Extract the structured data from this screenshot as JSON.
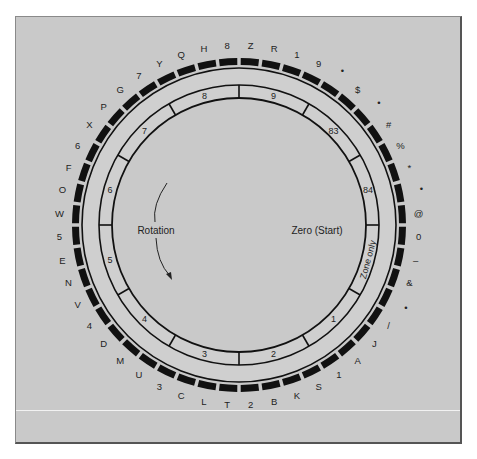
{
  "diagram": {
    "center_labels": {
      "rotation": "Rotation",
      "start": "Zero (Start)"
    },
    "cells": [
      {
        "row": "0",
        "char": "Z"
      },
      {
        "row": "11",
        "char": "R"
      },
      {
        "row": "12",
        "char": "1"
      },
      {
        "row": "N",
        "char": "9"
      },
      {
        "row": "0",
        "char": "•"
      },
      {
        "row": "11",
        "char": "$"
      },
      {
        "row": "12",
        "char": "•"
      },
      {
        "row": "N",
        "char": "#"
      },
      {
        "row": "0",
        "char": "%"
      },
      {
        "row": "11",
        "char": "*"
      },
      {
        "row": "12",
        "char": "•"
      },
      {
        "row": "N",
        "char": "@"
      },
      {
        "row": "0",
        "char": "0"
      },
      {
        "row": "11",
        "char": "–"
      },
      {
        "row": "12",
        "char": "&"
      },
      {
        "row": "N",
        "char": "•"
      },
      {
        "row": "0",
        "char": "/"
      },
      {
        "row": "11",
        "char": "J"
      },
      {
        "row": "12",
        "char": "A"
      },
      {
        "row": "N",
        "char": "1"
      },
      {
        "row": "0",
        "char": "S"
      },
      {
        "row": "11",
        "char": "K"
      },
      {
        "row": "12",
        "char": "B"
      },
      {
        "row": "N",
        "char": "2"
      },
      {
        "row": "0",
        "char": "T"
      },
      {
        "row": "11",
        "char": "L"
      },
      {
        "row": "12",
        "char": "C"
      },
      {
        "row": "N",
        "char": "3"
      },
      {
        "row": "0",
        "char": "U"
      },
      {
        "row": "11",
        "char": "M"
      },
      {
        "row": "12",
        "char": "D"
      },
      {
        "row": "N",
        "char": "4"
      },
      {
        "row": "0",
        "char": "V"
      },
      {
        "row": "11",
        "char": "N"
      },
      {
        "row": "12",
        "char": "E"
      },
      {
        "row": "N",
        "char": "5"
      },
      {
        "row": "0",
        "char": "W"
      },
      {
        "row": "11",
        "char": "O"
      },
      {
        "row": "12",
        "char": "F"
      },
      {
        "row": "N",
        "char": "6"
      },
      {
        "row": "0",
        "char": "X"
      },
      {
        "row": "11",
        "char": "P"
      },
      {
        "row": "12",
        "char": "G"
      },
      {
        "row": "N",
        "char": "7"
      },
      {
        "row": "0",
        "char": "Y"
      },
      {
        "row": "11",
        "char": "Q"
      },
      {
        "row": "12",
        "char": "H"
      },
      {
        "row": "N",
        "char": "8"
      }
    ],
    "zones": [
      "9",
      "83",
      "84",
      "Zone only",
      "1",
      "2",
      "3",
      "4",
      "5",
      "6",
      "7",
      "8"
    ],
    "colors": {
      "background": "#c9c9c9",
      "ink": "#111111",
      "cell_fill": "#cfcfcf"
    }
  }
}
